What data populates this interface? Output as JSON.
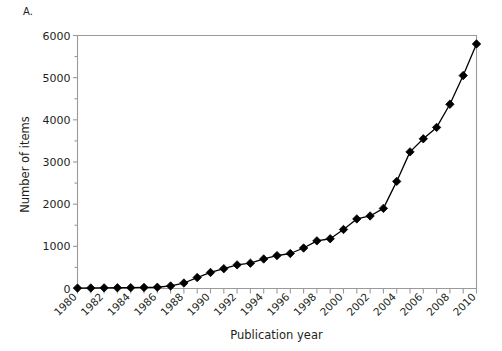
{
  "figure": {
    "panel_letter": "A.",
    "background_color": "#ffffff"
  },
  "chart_data": {
    "type": "line",
    "title": "",
    "panel_label": "A.",
    "xlabel": "Publication year",
    "ylabel": "Number of items",
    "x": [
      1980,
      1981,
      1982,
      1983,
      1984,
      1985,
      1986,
      1987,
      1988,
      1989,
      1990,
      1991,
      1992,
      1993,
      1994,
      1995,
      1996,
      1997,
      1998,
      1999,
      2000,
      2001,
      2002,
      2003,
      2004,
      2005,
      2006,
      2007,
      2008,
      2009,
      2010
    ],
    "values": [
      10,
      12,
      15,
      18,
      20,
      25,
      30,
      60,
      130,
      260,
      380,
      470,
      560,
      600,
      700,
      780,
      830,
      960,
      1130,
      1180,
      1400,
      1650,
      1720,
      1900,
      2540,
      3240,
      3550,
      3820,
      4370,
      5050,
      5800
    ],
    "series": [
      {
        "name": "Number of items",
        "marker": "diamond",
        "marker_color": "#000000",
        "line_color": "#000000",
        "values": [
          10,
          12,
          15,
          18,
          20,
          25,
          30,
          60,
          130,
          260,
          380,
          470,
          560,
          600,
          700,
          780,
          830,
          960,
          1130,
          1180,
          1400,
          1650,
          1720,
          1900,
          2540,
          3240,
          3550,
          3820,
          4370,
          5050,
          5800
        ]
      }
    ],
    "xlim": [
      1980,
      2010
    ],
    "ylim": [
      0,
      6000
    ],
    "ytick_labels": [
      "0",
      "1000",
      "2000",
      "3000",
      "4000",
      "5000",
      "6000"
    ],
    "ytick_values": [
      0,
      1000,
      2000,
      3000,
      4000,
      5000,
      6000
    ],
    "yminor_step": 500,
    "xtick_labels": [
      "1980",
      "1982",
      "1984",
      "1986",
      "1988",
      "1990",
      "1992",
      "1994",
      "1996",
      "1998",
      "2000",
      "2002",
      "2004",
      "2006",
      "2008",
      "2010"
    ],
    "xtick_values": [
      1980,
      1982,
      1984,
      1986,
      1988,
      1990,
      1992,
      1994,
      1996,
      1998,
      2000,
      2002,
      2004,
      2006,
      2008,
      2010
    ],
    "xtick_rotation": -45,
    "grid": false,
    "legend": false,
    "frame_color": "#9a9a9a",
    "axis_color": "#9a9a9a"
  }
}
